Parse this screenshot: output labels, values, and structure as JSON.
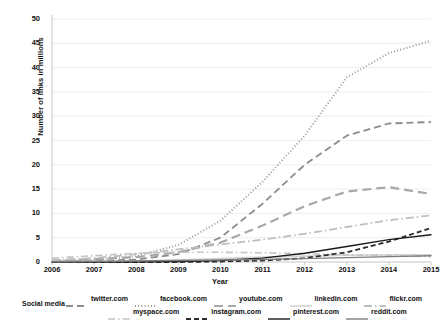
{
  "chart_data": {
    "type": "line",
    "title": "",
    "xlabel": "Year",
    "ylabel": "Number of links in millions",
    "x": [
      2006,
      2007,
      2008,
      2009,
      2010,
      2011,
      2012,
      2013,
      2014,
      2015
    ],
    "xtick_labels": [
      "2006",
      "2007",
      "2008",
      "2009",
      "2010",
      "2011",
      "2012",
      "2013",
      "2014",
      "2015"
    ],
    "ytick_labels": [
      "0",
      "5",
      "10",
      "15",
      "20",
      "25",
      "30",
      "35",
      "40",
      "45",
      "50"
    ],
    "yticks": [
      0,
      5,
      10,
      15,
      20,
      25,
      30,
      35,
      40,
      45,
      50
    ],
    "ylim": [
      0,
      50
    ],
    "xlim": [
      2006,
      2015
    ],
    "grid": true,
    "legend_position": "bottom",
    "legend_title": "Social media",
    "series": [
      {
        "name": "twitter.com",
        "color": "#8c8c8c",
        "dash": "7,4",
        "width": 1.8,
        "values": [
          0.1,
          0.2,
          0.5,
          1.6,
          5.0,
          12.0,
          20.0,
          26.0,
          28.5,
          28.8
        ]
      },
      {
        "name": "facebook.com",
        "color": "#9a9a9a",
        "dash": "1,2.2",
        "width": 2.0,
        "values": [
          0.2,
          0.4,
          1.2,
          3.5,
          8.5,
          16.5,
          26.0,
          38.0,
          43.0,
          45.5
        ]
      },
      {
        "name": "youtube.com",
        "color": "#a8a8a8",
        "dash": "9,5",
        "width": 2.2,
        "values": [
          0.3,
          0.6,
          1.0,
          2.0,
          4.0,
          7.5,
          11.5,
          14.5,
          15.4,
          14.0
        ]
      },
      {
        "name": "linkedin.com",
        "color": "#d3d3d3",
        "dash": "",
        "width": 1.6,
        "values": [
          0.05,
          0.1,
          0.2,
          0.4,
          0.7,
          1.0,
          1.2,
          1.4,
          1.5,
          1.5
        ]
      },
      {
        "name": "flickr.com",
        "color": "#bfbfbf",
        "dash": "8,3,1.5,3",
        "width": 1.8,
        "values": [
          0.4,
          0.8,
          1.6,
          2.6,
          3.6,
          4.6,
          5.8,
          7.2,
          8.6,
          9.6
        ]
      },
      {
        "name": "myspace.com",
        "color": "#c4c4c4",
        "dash": "7,3,1.5,3",
        "width": 1.6,
        "values": [
          0.8,
          1.3,
          1.8,
          2.0,
          2.0,
          1.9,
          1.7,
          1.5,
          1.3,
          1.1
        ]
      },
      {
        "name": "instagram.com",
        "color": "#2b2b2b",
        "dash": "5,3",
        "width": 1.8,
        "values": [
          0.0,
          0.0,
          0.0,
          0.0,
          0.1,
          0.3,
          0.8,
          2.0,
          4.2,
          7.0
        ]
      },
      {
        "name": "pinterest.com",
        "color": "#1a1a1a",
        "dash": "",
        "width": 1.4,
        "values": [
          0.0,
          0.0,
          0.0,
          0.1,
          0.3,
          0.8,
          1.8,
          3.2,
          4.6,
          5.6
        ]
      },
      {
        "name": "reddit.com",
        "color": "#7d7d7d",
        "dash": "",
        "width": 1.4,
        "values": [
          0.05,
          0.1,
          0.2,
          0.3,
          0.4,
          0.5,
          0.7,
          0.9,
          1.1,
          1.3
        ]
      }
    ]
  },
  "axes": {
    "ylabel": "Number of links in millions",
    "xlabel": "Year"
  },
  "legend": {
    "title": "Social media",
    "row1": [
      "twitter.com",
      "facebook.com",
      "youtube.com",
      "linkedin.com",
      "flickr.com"
    ],
    "row2": [
      "myspace.com",
      "instagram.com",
      "pinterest.com",
      "reddit.com"
    ]
  },
  "colors": {
    "grid": "#e6e6e6",
    "axis": "#bfbfbf",
    "text": "#111111",
    "background": "#ffffff"
  }
}
